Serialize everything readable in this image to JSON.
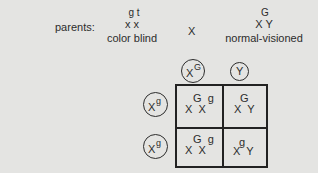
{
  "parents": {
    "label": "parents:",
    "mother": {
      "alleles": "g t",
      "chromosomes": "x x",
      "phenotype": "color blind"
    },
    "cross_symbol": "X",
    "father": {
      "allele": "G",
      "chromosomes": "X Y",
      "phenotype": "normal-visioned"
    }
  },
  "punnett": {
    "top_gametes": [
      {
        "base": "X",
        "sup": "G"
      },
      {
        "base": "Y",
        "sup": ""
      }
    ],
    "left_gametes": [
      {
        "base": "X",
        "sup": "g"
      },
      {
        "base": "X",
        "sup": "g"
      }
    ],
    "cells": [
      {
        "sup": "G  g",
        "base": "X  X"
      },
      {
        "sup": "G",
        "base": "X  Y"
      },
      {
        "sup": "G  g",
        "base": "X  X"
      },
      {
        "sup": "g",
        "base": "X  Y"
      }
    ]
  }
}
